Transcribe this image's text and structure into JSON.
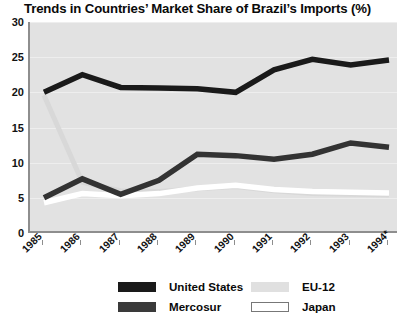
{
  "chart_data": {
    "type": "line",
    "title": "Trends in Countries’ Market Share of Brazil’s Imports (%)",
    "xlabel": "",
    "ylabel": "",
    "categories": [
      "1985",
      "1986",
      "1987",
      "1988",
      "1989",
      "1990",
      "1991",
      "1992",
      "1993",
      "1994*"
    ],
    "ylim": [
      0,
      30
    ],
    "yticks": [
      0,
      5,
      10,
      15,
      20,
      25,
      30
    ],
    "grid": true,
    "legend_position": "bottom",
    "series": [
      {
        "name": "United States",
        "color": "#1a1a1a",
        "values": [
          20.0,
          22.5,
          20.7,
          20.6,
          20.5,
          20.0,
          23.2,
          24.7,
          23.9,
          24.6
        ]
      },
      {
        "name": "Mercosur",
        "color": "#333333",
        "values": [
          5.0,
          7.7,
          5.5,
          7.5,
          11.2,
          11.0,
          10.5,
          11.2,
          12.8,
          12.2
        ]
      },
      {
        "name": "EU-12",
        "color": "#d8d8d8",
        "values": [
          19.6,
          7.2,
          6.0,
          5.9,
          6.3,
          6.6,
          6.0,
          5.6,
          5.5,
          5.4
        ]
      },
      {
        "name": "Japan",
        "color": "#ffffff",
        "values": [
          4.3,
          5.6,
          5.3,
          5.6,
          6.4,
          6.8,
          6.2,
          5.9,
          5.8,
          5.7
        ]
      }
    ]
  },
  "legend": {
    "entries": [
      {
        "label": "United States",
        "swatch": "#1a1a1a",
        "border": "none"
      },
      {
        "label": "Mercosur",
        "swatch": "#3a3a3a",
        "border": "none"
      },
      {
        "label": "EU-12",
        "swatch": "#e0e0e0",
        "border": "none"
      },
      {
        "label": "Japan",
        "swatch": "#ffffff",
        "border": "1px solid #777777"
      }
    ]
  }
}
